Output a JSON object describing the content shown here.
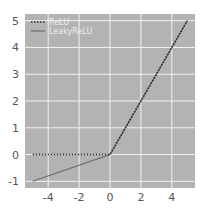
{
  "chart_data": {
    "type": "line",
    "title": "",
    "xlabel": "",
    "ylabel": "",
    "xlim": [
      -5.5,
      5.5
    ],
    "ylim": [
      -1.25,
      5.25
    ],
    "xticks": [
      -4,
      -2,
      0,
      2,
      4
    ],
    "xtick_labels": [
      "-4",
      "-2",
      "0",
      "2",
      "4"
    ],
    "yticks": [
      -1,
      0,
      1,
      2,
      3,
      4,
      5
    ],
    "ytick_labels": [
      "-1",
      "0",
      "1",
      "2",
      "3",
      "4",
      "5"
    ],
    "grid": true,
    "legend_position": "upper left",
    "series": [
      {
        "name": "ReLU",
        "style": "dotted",
        "color": "#2b2b2b",
        "x": [
          -5,
          0,
          5
        ],
        "y": [
          0,
          0,
          5
        ]
      },
      {
        "name": "LeakyReLU",
        "style": "solid",
        "color": "#6a6a6a",
        "x": [
          -5,
          0,
          5
        ],
        "y": [
          -1,
          0,
          5
        ]
      }
    ]
  },
  "colors": {
    "plot_background": "#b3b3b3",
    "grid": "#f2f2f2",
    "tick_text": "#555555"
  }
}
